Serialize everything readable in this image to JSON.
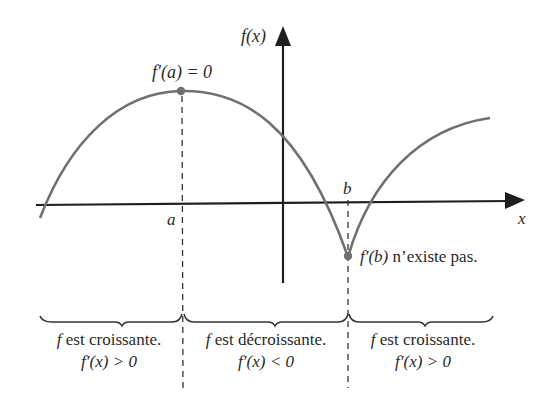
{
  "diagram": {
    "y_axis_label": "f(x)",
    "x_axis_label": "x",
    "point_a_label": "a",
    "point_b_label": "b",
    "max_annotation": "f′(a) = 0",
    "cusp_annotation_fn": "f′(b)",
    "cusp_annotation_text": " n’existe pas.",
    "regions": [
      {
        "line1_f": "f",
        "line1_text": " est croissante.",
        "line2": "f′(x) > 0"
      },
      {
        "line1_f": "f",
        "line1_text": " est décroissante.",
        "line2": "f′(x) < 0"
      },
      {
        "line1_f": "f",
        "line1_text": " est croissante.",
        "line2": "f′(x) > 0"
      }
    ],
    "colors": {
      "curve": "#707070",
      "axis": "#1e1e1e",
      "point": "#707070",
      "dashed": "#333333"
    }
  }
}
